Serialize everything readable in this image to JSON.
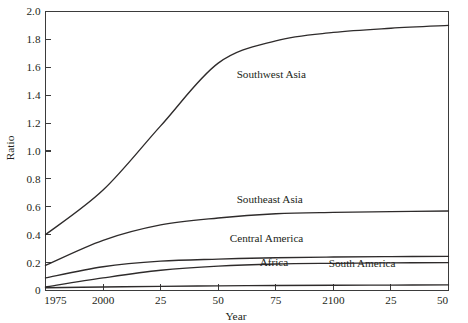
{
  "chart_data": {
    "type": "line",
    "title": "",
    "xlabel": "Year",
    "ylabel": "Ratio",
    "xlim": [
      1975,
      2150
    ],
    "ylim": [
      0,
      2.0
    ],
    "grid": false,
    "legend_position": "inline-labels",
    "x": [
      1975,
      2000,
      2025,
      2050,
      2075,
      2100,
      2125,
      2150
    ],
    "xticks": [
      1975,
      2000,
      2025,
      2050,
      2075,
      2100,
      2125,
      2150
    ],
    "xtick_labels": [
      "1975",
      "2000",
      "25",
      "50",
      "75",
      "2100",
      "25",
      "50"
    ],
    "yticks": [
      0,
      0.2,
      0.4,
      0.6,
      0.8,
      1.0,
      1.2,
      1.4,
      1.6,
      1.8,
      2.0
    ],
    "ytick_labels": [
      "0",
      "0.2",
      "0.4",
      "0.6",
      "0.8",
      "1.0",
      "1.2",
      "1.4",
      "1.6",
      "1.8",
      "2.0"
    ],
    "line_color": "#2e2b2b",
    "axis_color": "#3b3b3b",
    "background": "#ffffff",
    "series": [
      {
        "name": "Southwest Asia",
        "values": [
          0.4,
          0.72,
          1.18,
          1.63,
          1.79,
          1.85,
          1.88,
          1.9
        ],
        "label_x": 2058,
        "label_y": 1.52
      },
      {
        "name": "Southeast Asia",
        "values": [
          0.18,
          0.36,
          0.47,
          0.52,
          0.55,
          0.56,
          0.565,
          0.57
        ],
        "label_x": 2058,
        "label_y": 0.63
      },
      {
        "name": "Central America",
        "values": [
          0.09,
          0.17,
          0.21,
          0.225,
          0.235,
          0.24,
          0.243,
          0.245
        ],
        "label_x": 2055,
        "label_y": 0.345
      },
      {
        "name": "Africa",
        "values": [
          0.025,
          0.09,
          0.145,
          0.175,
          0.19,
          0.195,
          0.198,
          0.2
        ],
        "label_x": 2068,
        "label_y": 0.175
      },
      {
        "name": "South America",
        "values": [
          0.02,
          0.025,
          0.03,
          0.033,
          0.036,
          0.038,
          0.039,
          0.04
        ],
        "label_x": 2098,
        "label_y": 0.165
      }
    ]
  }
}
